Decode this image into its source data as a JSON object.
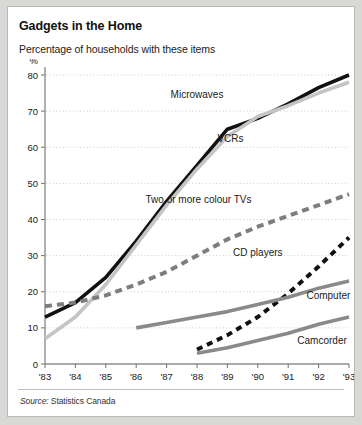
{
  "figure": {
    "title": "Gadgets in the Home",
    "subtitle": "Percentage of households with these items",
    "source_prefix": "Source:",
    "source_value": " Statistics Canada"
  },
  "chart_data": {
    "type": "line",
    "title": "Gadgets in the Home",
    "subtitle": "Percentage of households with these items",
    "xlabel": "",
    "ylabel": "%",
    "ylim": [
      0,
      80
    ],
    "xlim": [
      1983,
      1993
    ],
    "grid": true,
    "legend_position": "inline-annotations",
    "yticks": [
      0,
      10,
      20,
      30,
      40,
      50,
      60,
      70,
      80
    ],
    "ytick_labels": [
      "0",
      "10",
      "20",
      "30",
      "40",
      "50",
      "60",
      "70",
      "80"
    ],
    "x": [
      1983,
      1984,
      1985,
      1986,
      1987,
      1988,
      1989,
      1990,
      1991,
      1992,
      1993
    ],
    "xtick_labels": [
      "'83",
      "'84",
      "'85",
      "'86",
      "'87",
      "'88",
      "'89",
      "'90",
      "'91",
      "'92",
      "'93"
    ],
    "series": [
      {
        "name": "Microwaves",
        "color": "#111111",
        "style": "solid",
        "width": 3.6,
        "label_x": 1988.0,
        "label_y": 73.5,
        "label_anchor": "middle",
        "x": [
          1983,
          1984,
          1985,
          1986,
          1987,
          1988,
          1989,
          1990,
          1991,
          1992,
          1993
        ],
        "values": [
          13,
          17,
          24,
          34,
          45,
          55,
          65,
          68,
          72,
          76.5,
          80
        ]
      },
      {
        "name": "VCRs",
        "color": "#c4c4c4",
        "style": "solid",
        "width": 3.6,
        "label_x": 1989.1,
        "label_y": 61.5,
        "label_anchor": "middle",
        "x": [
          1983,
          1984,
          1985,
          1986,
          1987,
          1988,
          1989,
          1990,
          1991,
          1992,
          1993
        ],
        "values": [
          7,
          13,
          22,
          33,
          44,
          54,
          63,
          68.5,
          71.5,
          75,
          78
        ]
      },
      {
        "name": "Two or more colour TVs",
        "color": "#7d7d7d",
        "style": "dashed",
        "width": 4.0,
        "dash": "7 5",
        "label_x": 1988.05,
        "label_y": 44.5,
        "label_anchor": "middle",
        "x": [
          1983,
          1984,
          1985,
          1986,
          1987,
          1988,
          1989,
          1990,
          1991,
          1992,
          1993
        ],
        "values": [
          16,
          17,
          19,
          22,
          25.5,
          30,
          34.5,
          38,
          41,
          44,
          47
        ]
      },
      {
        "name": "CD players",
        "color": "#111111",
        "style": "dashed",
        "width": 4.0,
        "dash": "6 5",
        "label_x": 1990.0,
        "label_y": 30.0,
        "label_anchor": "middle",
        "x": [
          1988,
          1989,
          1990,
          1991,
          1992,
          1993
        ],
        "values": [
          4,
          8,
          13,
          19.5,
          27,
          35
        ]
      },
      {
        "name": "Computer",
        "color": "#8a8a8a",
        "style": "solid",
        "width": 3.6,
        "label_x": 1991.6,
        "label_y": 18.0,
        "label_anchor": "start",
        "x": [
          1986,
          1987,
          1988,
          1989,
          1990,
          1991,
          1992,
          1993
        ],
        "values": [
          10,
          11.5,
          13,
          14.5,
          16.5,
          18.5,
          21,
          23
        ]
      },
      {
        "name": "Camcorder",
        "color": "#8a8a8a",
        "style": "solid",
        "width": 3.6,
        "label_x": 1991.3,
        "label_y": 5.5,
        "label_anchor": "start",
        "x": [
          1988,
          1989,
          1990,
          1991,
          1992,
          1993
        ],
        "values": [
          3,
          4.5,
          6.5,
          8.5,
          11,
          13
        ]
      }
    ]
  }
}
